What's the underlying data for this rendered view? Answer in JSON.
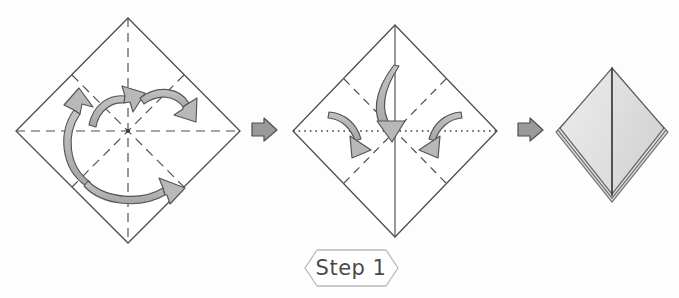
{
  "document": {
    "title": "Origami Preliminary Base Folding Instructions",
    "background_color": "#fdfdfd"
  },
  "step_banner": {
    "label": "Step 1",
    "shape": "hexagon-banner",
    "stroke_color": "#b9b9b9",
    "text_color": "#4a4a4a"
  },
  "palette": {
    "paper_outline": "#4d4d4d",
    "crease_line": "#4d4d4d",
    "arrow_fill": "#b3b3b3",
    "arrow_stroke": "#555555",
    "transition_arrow_fill": "#9a9a9a",
    "transition_arrow_stroke": "#4f4f4f",
    "paper_face_light": "#e4e4e4",
    "paper_face_shade": "#d6d6d6",
    "paper_edge": "#6b6b6b"
  },
  "figures": [
    {
      "id": "figure-1",
      "name": "square-with-all-creases",
      "caption_semantic": "Square sheet rotated 45 degrees showing four pre-creased fold lines",
      "center": {
        "x": 128,
        "y": 130
      },
      "radius": 112,
      "creases": [
        {
          "name": "vertical-crease",
          "style": "dashed",
          "from": "top-vertex",
          "to": "bottom-vertex"
        },
        {
          "name": "horizontal-crease",
          "style": "dashed",
          "from": "left-vertex",
          "to": "right-vertex"
        },
        {
          "name": "diagonal-crease-nw-se",
          "style": "dashed",
          "from": "upper-left-edge-mid",
          "to": "lower-right-edge-mid"
        },
        {
          "name": "diagonal-crease-ne-sw",
          "style": "dashed",
          "from": "upper-right-edge-mid",
          "to": "lower-left-edge-mid"
        }
      ],
      "arrows": [
        {
          "name": "rotation-arrow-left",
          "direction": "counter-clockwise-up",
          "head": "up"
        },
        {
          "name": "rotation-arrow-center",
          "direction": "clockwise-right",
          "head": "up-right"
        },
        {
          "name": "rotation-arrow-upper-right",
          "direction": "clockwise-down",
          "head": "down-right"
        },
        {
          "name": "rotation-arrow-bottom",
          "direction": "clockwise-right",
          "head": "right"
        }
      ]
    },
    {
      "id": "figure-2",
      "name": "square-collapsing-to-base",
      "caption_semantic": "Creased square collapsing: top point brought down to center, sides folding inward",
      "center": {
        "x": 395,
        "y": 131
      },
      "radius": 102,
      "creases": [
        {
          "name": "vertical-mountain-fold",
          "style": "solid",
          "from": "top-vertex",
          "to": "bottom-vertex"
        },
        {
          "name": "horizontal-valley-fold",
          "style": "dotted",
          "from": "left-vertex",
          "to": "right-vertex"
        },
        {
          "name": "diagonal-crease-upper-left",
          "style": "dashed"
        },
        {
          "name": "diagonal-crease-upper-right",
          "style": "dashed"
        },
        {
          "name": "diagonal-crease-lower-left",
          "style": "dashed"
        },
        {
          "name": "diagonal-crease-lower-right",
          "style": "dashed"
        }
      ],
      "arrows": [
        {
          "name": "collapse-arrow-center",
          "direction": "down-to-center",
          "head": "down"
        },
        {
          "name": "collapse-arrow-left",
          "direction": "inward-down-right",
          "head": "down-right"
        },
        {
          "name": "collapse-arrow-right",
          "direction": "inward-down-left",
          "head": "down-left"
        }
      ]
    },
    {
      "id": "figure-3",
      "name": "finished-preliminary-base",
      "caption_semantic": "Completed preliminary base, a shaded diamond with visible stacked paper layers",
      "center": {
        "x": 612,
        "y": 132
      },
      "half_width": 58,
      "half_height": 64,
      "layers": 3,
      "center_line": {
        "name": "center-ridge-line",
        "style": "solid"
      }
    }
  ],
  "transitions": [
    {
      "id": "transition-1",
      "name": "arrow-figure1-to-figure2",
      "glyph": "right-arrow",
      "x": 264,
      "y": 129
    },
    {
      "id": "transition-2",
      "name": "arrow-figure2-to-figure3",
      "glyph": "right-arrow",
      "x": 530,
      "y": 129
    }
  ]
}
